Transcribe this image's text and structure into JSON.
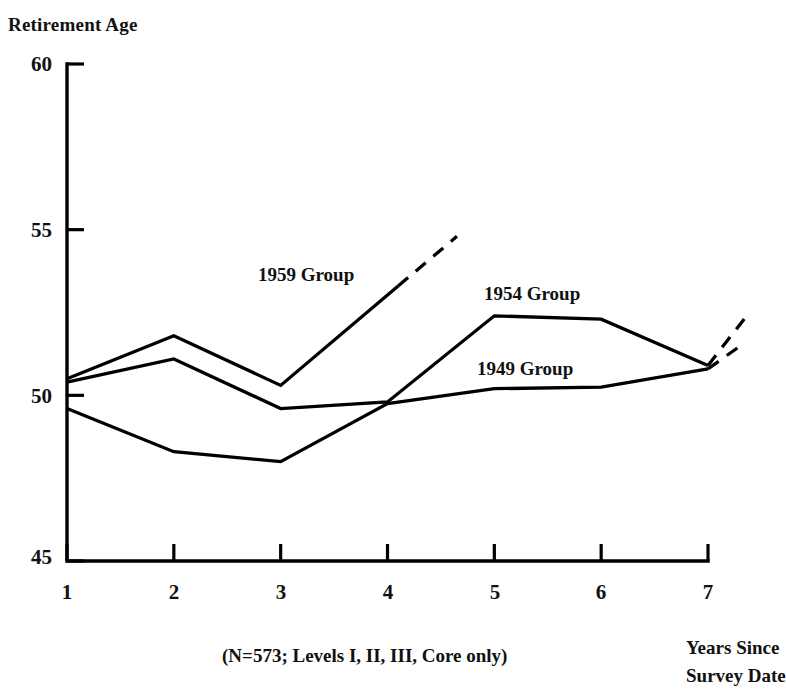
{
  "chart_data": {
    "type": "line",
    "title": "",
    "ylabel": "Retirement Age",
    "xlabel": "Years Since Survey Date",
    "footnote": "(N=573; Levels I, II, III, Core only)",
    "x": [
      1,
      2,
      3,
      4,
      5,
      6,
      7
    ],
    "xlim": [
      1,
      7
    ],
    "ylim": [
      45,
      60
    ],
    "yticks": [
      45,
      50,
      55,
      60
    ],
    "xticks": [
      1,
      2,
      3,
      4,
      5,
      6,
      7
    ],
    "grid": false,
    "legend_position": "inline-annotations",
    "series": [
      {
        "name": "1959 Group",
        "solid_x": [
          1,
          2,
          3,
          4.1
        ],
        "solid_values": [
          50.5,
          51.8,
          50.3,
          53.3
        ],
        "dashed_x": [
          4.1,
          4.65
        ],
        "dashed_values": [
          53.3,
          54.8
        ],
        "label": "1959 Group"
      },
      {
        "name": "1954 Group",
        "solid_x": [
          1,
          2,
          3,
          4,
          5,
          6,
          7
        ],
        "solid_values": [
          50.4,
          51.1,
          49.6,
          49.8,
          52.4,
          52.3,
          50.9
        ],
        "dashed_x": [
          7,
          7.35
        ],
        "dashed_values": [
          50.9,
          52.35
        ],
        "label": "1954 Group"
      },
      {
        "name": "1949 Group",
        "solid_x": [
          1,
          2,
          3,
          4,
          5,
          6,
          7
        ],
        "solid_values": [
          49.6,
          48.3,
          48.0,
          49.75,
          50.2,
          50.25,
          50.8
        ],
        "dashed_x": [
          7,
          7.35
        ],
        "dashed_values": [
          50.8,
          51.6
        ],
        "label": "1949 Group"
      }
    ]
  },
  "axes": {
    "y_title": "Retirement Age",
    "y_tick_labels": [
      "60",
      "55",
      "50",
      "45"
    ],
    "x_tick_labels": [
      "1",
      "2",
      "3",
      "4",
      "5",
      "6",
      "7"
    ],
    "x_axis_note_line1": "Years Since",
    "x_axis_note_line2": "Survey Date"
  },
  "annotations": {
    "series_1959": "1959 Group",
    "series_1954": "1954 Group",
    "series_1949": "1949 Group",
    "footnote": "(N=573; Levels I, II, III, Core only)"
  },
  "colors": {
    "line": "#000000",
    "axis": "#000000",
    "background": "#ffffff",
    "text": "#111111"
  }
}
